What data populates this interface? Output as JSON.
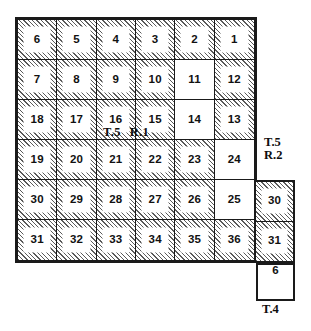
{
  "diagram": {
    "type": "plss-township-diagram"
  },
  "main_block": {
    "name": "T.5 R.1",
    "label": "T.5",
    "label_secondary": "R.1",
    "rows": 6,
    "cols": 6,
    "sections": [
      [
        {
          "number": "6",
          "fill": "hatched"
        },
        {
          "number": "5",
          "fill": "hatched"
        },
        {
          "number": "4",
          "fill": "hatched"
        },
        {
          "number": "3",
          "fill": "hatched"
        },
        {
          "number": "2",
          "fill": "hatched"
        },
        {
          "number": "1",
          "fill": "hatched"
        }
      ],
      [
        {
          "number": "7",
          "fill": "hatched"
        },
        {
          "number": "8",
          "fill": "hatched"
        },
        {
          "number": "9",
          "fill": "hatched"
        },
        {
          "number": "10",
          "fill": "hatched"
        },
        {
          "number": "11",
          "fill": "plain"
        },
        {
          "number": "12",
          "fill": "hatched"
        }
      ],
      [
        {
          "number": "18",
          "fill": "hatched"
        },
        {
          "number": "17",
          "fill": "hatched"
        },
        {
          "number": "16",
          "fill": "hatched"
        },
        {
          "number": "15",
          "fill": "hatched"
        },
        {
          "number": "14",
          "fill": "plain"
        },
        {
          "number": "13",
          "fill": "hatched"
        }
      ],
      [
        {
          "number": "19",
          "fill": "hatched"
        },
        {
          "number": "20",
          "fill": "hatched"
        },
        {
          "number": "21",
          "fill": "hatched"
        },
        {
          "number": "22",
          "fill": "hatched"
        },
        {
          "number": "23",
          "fill": "hatched"
        },
        {
          "number": "24",
          "fill": "plain"
        }
      ],
      [
        {
          "number": "30",
          "fill": "hatched"
        },
        {
          "number": "29",
          "fill": "hatched"
        },
        {
          "number": "28",
          "fill": "hatched"
        },
        {
          "number": "27",
          "fill": "hatched"
        },
        {
          "number": "26",
          "fill": "hatched"
        },
        {
          "number": "25",
          "fill": "plain"
        }
      ],
      [
        {
          "number": "31",
          "fill": "hatched"
        },
        {
          "number": "32",
          "fill": "hatched"
        },
        {
          "number": "33",
          "fill": "hatched"
        },
        {
          "number": "34",
          "fill": "hatched"
        },
        {
          "number": "35",
          "fill": "hatched"
        },
        {
          "number": "36",
          "fill": "hatched"
        }
      ]
    ]
  },
  "side_block": {
    "name": "T.5 R.2",
    "label_line1": "T.5",
    "label_line2": "R.2",
    "sections": [
      {
        "number": "30",
        "fill": "hatched"
      },
      {
        "number": "31",
        "fill": "hatched"
      }
    ]
  },
  "lower_block": {
    "name": "T.4",
    "label": "T.4",
    "sections": [
      {
        "number": "6",
        "fill": "plain"
      }
    ]
  },
  "colors": {
    "border": "#1a1a1a",
    "hatch_line": "#5a5a5a",
    "paper": "#ffffff",
    "text": "#111111"
  }
}
